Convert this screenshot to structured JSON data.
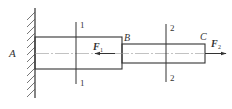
{
  "diagram": {
    "type": "stepped-bar-axial-load",
    "colors": {
      "line": "#333333",
      "centerline": "#888888",
      "background": "#ffffff"
    },
    "labels": {
      "support": "A",
      "step": "B",
      "end": "C",
      "force1": "F",
      "force1_sub": "1",
      "force2": "F",
      "force2_sub": "2",
      "section1_top": "1",
      "section1_bottom": "1",
      "section2_top": "2",
      "section2_bottom": "2"
    }
  }
}
